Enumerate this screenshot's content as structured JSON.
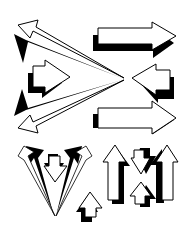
{
  "artwork": {
    "title": "",
    "description": "Black and white clip art collection of outlined arrows with drop shadows",
    "colors": {
      "fill": "#ffffff",
      "outline": "#000000",
      "shadow": "#000000",
      "background": "#ffffff"
    },
    "groups": [
      {
        "name": "converging-left-arrows",
        "direction": "left-pointing-outward",
        "count": 3
      },
      {
        "name": "right-block-arrows",
        "direction": "right",
        "count": 2
      },
      {
        "name": "small-left-arrow",
        "direction": "left",
        "count": 1
      },
      {
        "name": "v-arrow-cluster",
        "direction": "up",
        "count": 3
      },
      {
        "name": "tall-up-arrows",
        "direction": "up",
        "count": 2
      },
      {
        "name": "hourglass-arrows",
        "direction": "down-and-up",
        "count": 2
      },
      {
        "name": "small-up-arrow",
        "direction": "up",
        "count": 1
      }
    ]
  }
}
